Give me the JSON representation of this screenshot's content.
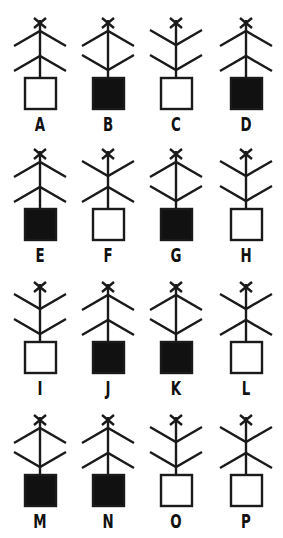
{
  "diagram": {
    "type": "figure-matrix",
    "rows": 4,
    "columns": 4,
    "stroke_color": "#1a1a1a",
    "fill_color": "#111111",
    "empty_fill": "#ffffff",
    "legend": {
      "branch_down": "arms slope downward from the stem (tent / ^ shape)",
      "branch_up": "arms slope upward from the stem (V shape)"
    },
    "figures": [
      {
        "label": "A",
        "row": 0,
        "col": 0,
        "upper": "down",
        "lower": "down",
        "box": "open"
      },
      {
        "label": "B",
        "row": 0,
        "col": 1,
        "upper": "down",
        "lower": "up",
        "box": "filled"
      },
      {
        "label": "C",
        "row": 0,
        "col": 2,
        "upper": "up",
        "lower": "up",
        "box": "open"
      },
      {
        "label": "D",
        "row": 0,
        "col": 3,
        "upper": "down",
        "lower": "down",
        "box": "filled"
      },
      {
        "label": "E",
        "row": 1,
        "col": 0,
        "upper": "down",
        "lower": "down",
        "box": "filled"
      },
      {
        "label": "F",
        "row": 1,
        "col": 1,
        "upper": "up",
        "lower": "down",
        "box": "open"
      },
      {
        "label": "G",
        "row": 1,
        "col": 2,
        "upper": "down",
        "lower": "up",
        "box": "filled"
      },
      {
        "label": "H",
        "row": 1,
        "col": 3,
        "upper": "up",
        "lower": "up",
        "box": "open"
      },
      {
        "label": "I",
        "row": 2,
        "col": 0,
        "upper": "up",
        "lower": "up",
        "box": "open"
      },
      {
        "label": "J",
        "row": 2,
        "col": 1,
        "upper": "down",
        "lower": "down",
        "box": "filled"
      },
      {
        "label": "K",
        "row": 2,
        "col": 2,
        "upper": "down",
        "lower": "up",
        "box": "filled"
      },
      {
        "label": "L",
        "row": 2,
        "col": 3,
        "upper": "up",
        "lower": "down",
        "box": "open"
      },
      {
        "label": "M",
        "row": 3,
        "col": 0,
        "upper": "down",
        "lower": "up",
        "box": "filled"
      },
      {
        "label": "N",
        "row": 3,
        "col": 1,
        "upper": "down",
        "lower": "down",
        "box": "filled"
      },
      {
        "label": "O",
        "row": 3,
        "col": 2,
        "upper": "up",
        "lower": "up",
        "box": "open"
      },
      {
        "label": "P",
        "row": 3,
        "col": 3,
        "upper": "up",
        "lower": "down",
        "box": "open"
      }
    ]
  }
}
